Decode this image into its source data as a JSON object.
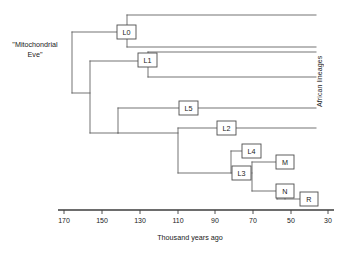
{
  "figure": {
    "root_label": "\"Mitochondrial\nEve\"",
    "side_label": "African lineages",
    "axis_title": "Thousand years ago"
  },
  "chart_data": {
    "type": "diagram",
    "subtype": "phylogenetic-tree",
    "title": "",
    "xlabel": "Thousand years ago",
    "ylabel": "",
    "xlim": [
      175,
      28
    ],
    "x_ticks": [
      170,
      150,
      130,
      110,
      90,
      70,
      50,
      30
    ],
    "x_tick_labels": [
      "170",
      "150",
      "130",
      "110",
      "90",
      "70",
      "50",
      "30"
    ],
    "axis_direction": "decreasing-left-to-right",
    "grid": false,
    "legend": "none",
    "annotations": [
      {
        "text": "\"Mitochondrial Eve\"",
        "target": "root",
        "position": "left"
      },
      {
        "text": "African lineages",
        "target": "upper-tip-bracket",
        "position": "right-vertical"
      }
    ],
    "nodes": [
      {
        "id": "root",
        "label": "",
        "age_kya": 165,
        "boxed": false
      },
      {
        "id": "L0",
        "label": "L0",
        "age_kya": 141,
        "boxed": true
      },
      {
        "id": "n2",
        "label": "",
        "age_kya": 156,
        "boxed": false
      },
      {
        "id": "L1",
        "label": "L1",
        "age_kya": 130,
        "boxed": true
      },
      {
        "id": "n3",
        "label": "",
        "age_kya": 141,
        "boxed": false
      },
      {
        "id": "L5",
        "label": "L5",
        "age_kya": 109,
        "boxed": true
      },
      {
        "id": "L2",
        "label": "L2",
        "age_kya": 89,
        "boxed": true
      },
      {
        "id": "n4",
        "label": "",
        "age_kya": 111,
        "boxed": false
      },
      {
        "id": "L4",
        "label": "L4",
        "age_kya": 78,
        "boxed": true
      },
      {
        "id": "L3",
        "label": "L3",
        "age_kya": 73,
        "boxed": true
      },
      {
        "id": "M",
        "label": "M",
        "age_kya": 60,
        "boxed": true
      },
      {
        "id": "N",
        "label": "N",
        "age_kya": 60,
        "boxed": true
      },
      {
        "id": "R",
        "label": "R",
        "age_kya": 47,
        "boxed": true
      }
    ],
    "edges": [
      {
        "parent": "root",
        "child": "L0"
      },
      {
        "parent": "root",
        "child": "n2"
      },
      {
        "parent": "n2",
        "child": "L1"
      },
      {
        "parent": "n2",
        "child": "n3"
      },
      {
        "parent": "n3",
        "child": "L5"
      },
      {
        "parent": "n3",
        "child": "n4"
      },
      {
        "parent": "n4",
        "child": "L2"
      },
      {
        "parent": "n4",
        "child": "L3"
      },
      {
        "parent": "L3",
        "child": "L4"
      },
      {
        "parent": "L3",
        "child": "M"
      },
      {
        "parent": "L3",
        "child": "N"
      },
      {
        "parent": "N",
        "child": "R"
      }
    ],
    "tips": [
      {
        "from": "L0",
        "group": "African lineages"
      },
      {
        "from": "L0",
        "group": "African lineages"
      },
      {
        "from": "L1",
        "group": "African lineages"
      },
      {
        "from": "L1",
        "group": "African lineages"
      },
      {
        "from": "L5",
        "group": "African lineages"
      },
      {
        "from": "L2",
        "group": "African lineages"
      },
      {
        "from": "L4",
        "group": "non-African descendant"
      },
      {
        "from": "M",
        "group": "non-African descendant"
      },
      {
        "from": "N",
        "group": "non-African descendant"
      },
      {
        "from": "R",
        "group": "non-African descendant"
      }
    ]
  },
  "boxes": [
    {
      "id": "L0",
      "label": "L0",
      "x": 117,
      "y": 25,
      "w": 19,
      "h": 14
    },
    {
      "id": "L1",
      "label": "L1",
      "x": 138,
      "y": 53,
      "w": 19,
      "h": 14
    },
    {
      "id": "L5",
      "label": "L5",
      "x": 179,
      "y": 101,
      "w": 19,
      "h": 14
    },
    {
      "id": "L2",
      "label": "L2",
      "x": 217,
      "y": 121,
      "w": 19,
      "h": 14
    },
    {
      "id": "L4",
      "label": "L4",
      "x": 242,
      "y": 144,
      "w": 19,
      "h": 14
    },
    {
      "id": "L3",
      "label": "L3",
      "x": 232,
      "y": 166,
      "w": 19,
      "h": 14
    },
    {
      "id": "M",
      "label": "M",
      "x": 276,
      "y": 155,
      "w": 18,
      "h": 14
    },
    {
      "id": "N",
      "label": "N",
      "x": 276,
      "y": 184,
      "w": 18,
      "h": 14
    },
    {
      "id": "R",
      "label": "R",
      "x": 300,
      "y": 192,
      "w": 18,
      "h": 14
    }
  ],
  "ticks": [
    {
      "value": "170",
      "x": 64
    },
    {
      "value": "150",
      "x": 102
    },
    {
      "value": "130",
      "x": 140
    },
    {
      "value": "110",
      "x": 178
    },
    {
      "value": "90",
      "x": 215
    },
    {
      "value": "70",
      "x": 253
    },
    {
      "value": "50",
      "x": 291
    },
    {
      "value": "30",
      "x": 328
    }
  ]
}
